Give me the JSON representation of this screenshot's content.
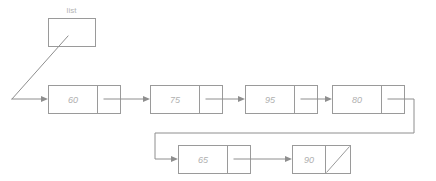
{
  "diagram": {
    "kind": "singly-linked-list",
    "head_pointer": {
      "label": "list",
      "box": {
        "x": 48,
        "y": 18,
        "width": 47,
        "height": 28
      }
    },
    "null_marker": "diagonal-slash",
    "colors": {
      "background": "#ffffff",
      "box_stroke": "#9a9a9a",
      "link_stroke": "#8e8e8e",
      "value_text": "#b0b0b0",
      "label_text": "#b4b4b4"
    },
    "nodes": [
      {
        "value": "60",
        "row": "top",
        "x": 48,
        "y": 85,
        "data_width": 49,
        "ptr_width": 23
      },
      {
        "value": "75",
        "row": "top",
        "x": 150,
        "y": 85,
        "data_width": 49,
        "ptr_width": 23
      },
      {
        "value": "95",
        "row": "top",
        "x": 245,
        "y": 85,
        "data_width": 49,
        "ptr_width": 23
      },
      {
        "value": "80",
        "row": "top",
        "x": 332,
        "y": 85,
        "data_width": 49,
        "ptr_width": 23,
        "wraps": true
      },
      {
        "value": "65",
        "row": "bottom",
        "x": 178,
        "y": 145,
        "data_width": 49,
        "ptr_width": 23
      },
      {
        "value": "90",
        "row": "bottom",
        "x": 292,
        "y": 145,
        "data_width": 49,
        "ptr_width": 23,
        "is_tail": true
      }
    ],
    "edges": [
      {
        "from": "list",
        "to": "60",
        "style": "diagonal-then-horizontal"
      },
      {
        "from": "60",
        "to": "75",
        "style": "horizontal"
      },
      {
        "from": "75",
        "to": "95",
        "style": "horizontal"
      },
      {
        "from": "95",
        "to": "80",
        "style": "horizontal"
      },
      {
        "from": "80",
        "to": "65",
        "style": "wrap-around-down-left"
      },
      {
        "from": "65",
        "to": "90",
        "style": "horizontal"
      },
      {
        "from": "90",
        "to": "null",
        "style": "null-slash"
      }
    ]
  }
}
